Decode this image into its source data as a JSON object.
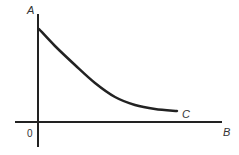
{
  "diagram": {
    "type": "decay-curve-graph",
    "axes": {
      "y_label": "A",
      "x_label": "B",
      "origin_label": "0"
    },
    "curve": {
      "label": "C",
      "description": "Decreasing curve starting high on axis A, leveling off toward axis B",
      "points": [
        [
          39,
          29
        ],
        [
          55,
          46
        ],
        [
          75,
          65
        ],
        [
          95,
          83
        ],
        [
          115,
          97
        ],
        [
          135,
          105
        ],
        [
          155,
          109
        ],
        [
          177,
          111
        ]
      ]
    },
    "colors": {
      "line": "#222222",
      "text": "#333333",
      "background": "#ffffff"
    }
  }
}
